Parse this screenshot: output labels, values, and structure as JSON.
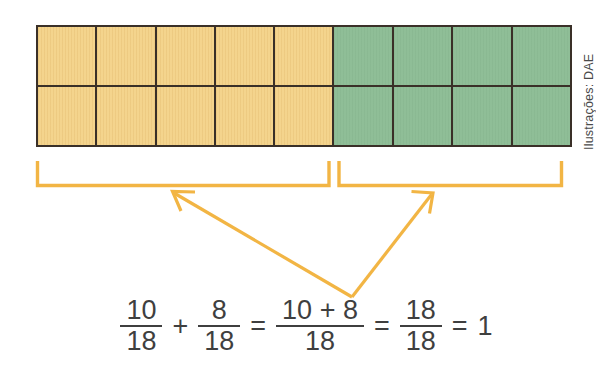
{
  "figure": {
    "credit": "Ilustrações: DAE",
    "colors": {
      "yellow": "#f4d48d",
      "green": "#8fbe97",
      "grid_line": "#3a3028",
      "accent_orange": "#f2b544",
      "text": "#3f3f3f",
      "background": "#ffffff"
    }
  },
  "bar_model": {
    "rows": 2,
    "columns": 9,
    "total_parts": 18,
    "yellow_columns": 5,
    "green_columns": 4,
    "yellow_parts": 10,
    "green_parts": 8,
    "row_top": [
      "yellow",
      "yellow",
      "yellow",
      "yellow",
      "yellow",
      "green",
      "green",
      "green",
      "green"
    ],
    "row_bottom": [
      "yellow",
      "yellow",
      "yellow",
      "yellow",
      "yellow",
      "green",
      "green",
      "green",
      "green"
    ]
  },
  "brackets": {
    "left_group_label": "10/18",
    "right_group_label": "8/18",
    "arrow_count": 2
  },
  "equation": {
    "parts": [
      {
        "kind": "fraction",
        "numerator": "10",
        "denominator": "18"
      },
      {
        "kind": "operator",
        "symbol": "+"
      },
      {
        "kind": "fraction",
        "numerator": "8",
        "denominator": "18"
      },
      {
        "kind": "operator",
        "symbol": "="
      },
      {
        "kind": "fraction",
        "numerator": "10 + 8",
        "denominator": "18"
      },
      {
        "kind": "operator",
        "symbol": "="
      },
      {
        "kind": "fraction",
        "numerator": "18",
        "denominator": "18"
      },
      {
        "kind": "operator",
        "symbol": "="
      },
      {
        "kind": "whole",
        "value": "1"
      }
    ],
    "plain_text": "10/18 + 8/18 = (10 + 8)/18 = 18/18 = 1"
  }
}
